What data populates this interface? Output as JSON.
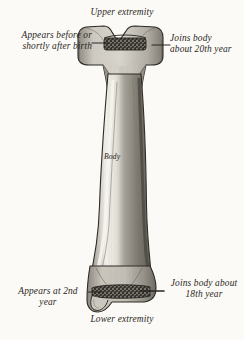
{
  "figure": {
    "background_color": "#fbfaf7",
    "ink_color": "#2a2722",
    "bone_fill_light": "#cfccc4",
    "bone_fill_mid": "#9a968c",
    "bone_fill_dark": "#6d6a62",
    "epiphyseal_band_color": "#3b3832"
  },
  "labels": {
    "upper_extremity": "Upper extremity",
    "lower_extremity": "Lower extremity",
    "appears_before_birth": "Appears before or\nshortly after birth",
    "joins_body_20th": "Joins body\nabout 20th year",
    "appears_2nd_year": "Appears at 2nd\nyear",
    "joins_body_18th": "Joins body about\n18th year",
    "body": "Body"
  },
  "annotations": {
    "leader_lines": [
      {
        "name": "leader-upper-left",
        "x1": 92,
        "y1": 43,
        "x2": 108,
        "y2": 43
      },
      {
        "name": "leader-upper-right",
        "x1": 152,
        "y1": 45,
        "x2": 168,
        "y2": 45
      },
      {
        "name": "leader-lower-left",
        "x1": 88,
        "y1": 292,
        "x2": 104,
        "y2": 292
      },
      {
        "name": "leader-lower-right",
        "x1": 140,
        "y1": 291,
        "x2": 162,
        "y2": 291
      }
    ]
  }
}
